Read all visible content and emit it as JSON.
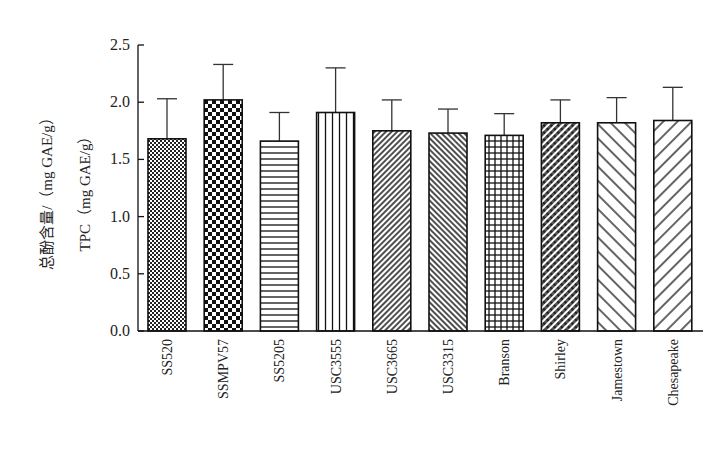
{
  "chart_data": {
    "type": "bar",
    "title": "",
    "xlabel": "",
    "ylabel": "总酚含量/（mg GAE/g）",
    "ylabel_line2": "TPC（mg GAE/g）",
    "ylim": [
      0,
      2.5
    ],
    "yticks": [
      "0.0",
      "0.5",
      "1.0",
      "1.5",
      "2.0",
      "2.5"
    ],
    "grid": false,
    "legend": null,
    "categories": [
      "SS520",
      "SSMPV57",
      "SS5205",
      "USC3555",
      "USC3665",
      "USC3315",
      "Branson",
      "Shirley",
      "Jamestown",
      "Chesapeake"
    ],
    "values": [
      1.68,
      2.02,
      1.66,
      1.91,
      1.75,
      1.73,
      1.71,
      1.82,
      1.82,
      1.84
    ],
    "error_upper": [
      0.35,
      0.31,
      0.25,
      0.39,
      0.27,
      0.21,
      0.19,
      0.2,
      0.22,
      0.29
    ],
    "patterns": [
      "fine-checker",
      "coarse-checker",
      "horizontal-lines",
      "vertical-lines",
      "dense-diag-forward",
      "dense-diag-back",
      "grid",
      "dense-diag-cross",
      "sparse-diag-back",
      "sparse-diag-forward"
    ],
    "colors": {
      "stroke": "#111111",
      "fill": "#ffffff"
    }
  }
}
